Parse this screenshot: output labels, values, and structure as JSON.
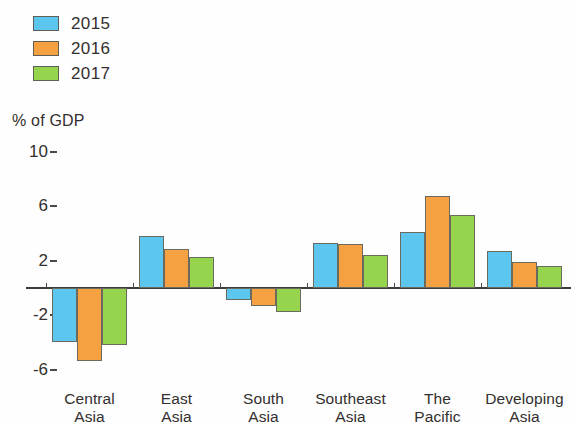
{
  "legend": {
    "items": [
      {
        "label": "2015",
        "color": "#5CC6EE"
      },
      {
        "label": "2016",
        "color": "#F5A142"
      },
      {
        "label": "2017",
        "color": "#95D44C"
      }
    ]
  },
  "axis_unit_label": "% of GDP",
  "chart_data": {
    "type": "bar",
    "title": "",
    "subtitle": "",
    "xlabel": "",
    "ylabel": "% of GDP",
    "ylim": [
      -8,
      10
    ],
    "yticks": [
      10,
      6,
      2,
      -2,
      -6
    ],
    "ytick_labels": [
      "10",
      "6",
      "2",
      "-2",
      "-6"
    ],
    "grid": false,
    "legend_position": "top-left",
    "categories": [
      "Central Asia",
      "East Asia",
      "South Asia",
      "Southeast Asia",
      "The Pacific",
      "Developing Asia"
    ],
    "category_lines": [
      [
        "Central",
        "Asia"
      ],
      [
        "East",
        "Asia"
      ],
      [
        "South",
        "Asia"
      ],
      [
        "Southeast",
        "Asia"
      ],
      [
        "The",
        "Pacific"
      ],
      [
        "Developing",
        "Asia"
      ]
    ],
    "series": [
      {
        "name": "2015",
        "color": "#5CC6EE",
        "values": [
          -4.0,
          3.8,
          -0.9,
          3.3,
          4.1,
          2.7
        ]
      },
      {
        "name": "2016",
        "color": "#F5A142",
        "values": [
          -5.4,
          2.9,
          -1.3,
          3.2,
          6.8,
          1.9
        ]
      },
      {
        "name": "2017",
        "color": "#95D44C",
        "values": [
          -4.2,
          2.3,
          -1.8,
          2.4,
          5.4,
          1.6
        ]
      }
    ]
  }
}
